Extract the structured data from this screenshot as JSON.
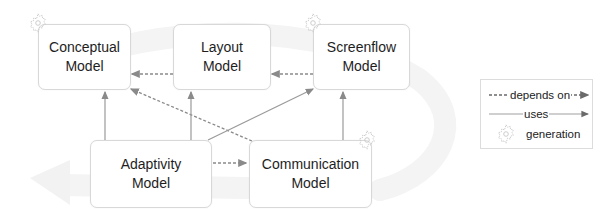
{
  "diagram": {
    "nodes": {
      "conceptual": {
        "line1": "Conceptual",
        "line2": "Model",
        "generation": true
      },
      "layout": {
        "line1": "Layout",
        "line2": "Model",
        "generation": false
      },
      "screenflow": {
        "line1": "Screenflow",
        "line2": "Model",
        "generation": true
      },
      "adaptivity": {
        "line1": "Adaptivity",
        "line2": "Model",
        "generation": false
      },
      "communication": {
        "line1": "Communication",
        "line2": "Model",
        "generation": true
      }
    },
    "edges": [
      {
        "from": "layout",
        "to": "conceptual",
        "type": "depends on"
      },
      {
        "from": "screenflow",
        "to": "layout",
        "type": "depends on"
      },
      {
        "from": "communication",
        "to": "conceptual",
        "type": "depends on"
      },
      {
        "from": "adaptivity",
        "to": "communication",
        "type": "depends on"
      },
      {
        "from": "adaptivity",
        "to": "conceptual",
        "type": "uses"
      },
      {
        "from": "adaptivity",
        "to": "layout",
        "type": "uses"
      },
      {
        "from": "adaptivity",
        "to": "screenflow",
        "type": "uses"
      },
      {
        "from": "communication",
        "to": "screenflow",
        "type": "uses"
      }
    ],
    "background": "cyclic-arrow"
  },
  "legend": {
    "depends_on": "depends on",
    "uses": "uses",
    "generation": "generation"
  },
  "colors": {
    "arrow": "#8a8a8a",
    "box_border": "#d8d8d8",
    "gear": "#c8c8c8",
    "background_arrow": "#f3f3f3"
  }
}
